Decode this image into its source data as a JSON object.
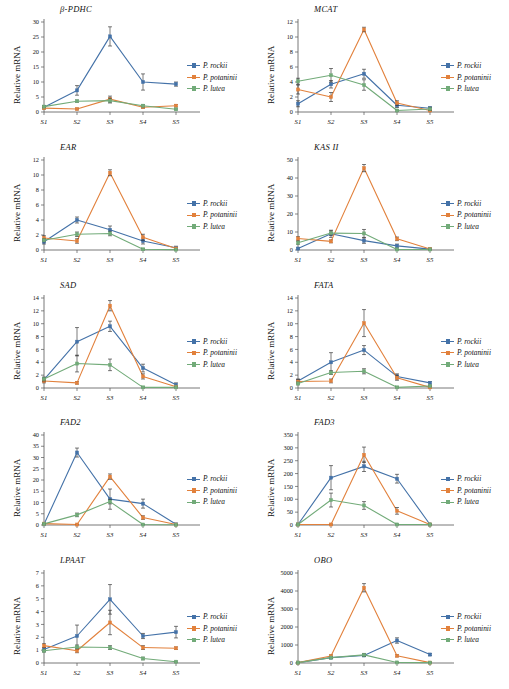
{
  "figure": {
    "axis_ylabel": "Relative mRNA",
    "categories": [
      "S1",
      "S2",
      "S3",
      "S4",
      "S5"
    ],
    "series_names": [
      "P. rockii",
      "P. potaninii",
      "P. lutea"
    ],
    "colors": {
      "p_rockii": "#4472a8",
      "p_potaninii": "#e2813c",
      "p_lutea": "#72ab79"
    }
  },
  "legend": {
    "items": [
      {
        "label": "P. rockii",
        "color": "#4472a8"
      },
      {
        "label": "P. potaninii",
        "color": "#e2813c"
      },
      {
        "label": "P. lutea",
        "color": "#72ab79"
      }
    ]
  },
  "chart_data": [
    {
      "type": "line",
      "title": "β-PDHC",
      "xlabel": "",
      "ylabel": "Relative mRNA",
      "categories": [
        "S1",
        "S2",
        "S3",
        "S4",
        "S5"
      ],
      "yticks": [
        0,
        5,
        10,
        15,
        20,
        25,
        30
      ],
      "ylim": [
        0,
        30
      ],
      "grid": false,
      "legend_position": "right",
      "series": [
        {
          "name": "P. rockii",
          "color": "#4472a8",
          "values": [
            1.6,
            7.2,
            25.2,
            10.0,
            9.3
          ],
          "errors": [
            0.5,
            1.6,
            3.2,
            2.7,
            0.7
          ]
        },
        {
          "name": "P. potaninii",
          "color": "#e2813c",
          "values": [
            1.3,
            1.0,
            4.3,
            1.6,
            2.1
          ],
          "errors": [
            0.3,
            0.3,
            1.0,
            0.4,
            0.4
          ]
        },
        {
          "name": "P. lutea",
          "color": "#72ab79",
          "values": [
            1.8,
            3.6,
            3.8,
            2.1,
            0.9
          ],
          "errors": [
            0.3,
            0.4,
            0.8,
            0.4,
            0.2
          ]
        }
      ]
    },
    {
      "type": "line",
      "title": "MCAT",
      "xlabel": "",
      "ylabel": "Relative mRNA",
      "categories": [
        "S1",
        "S2",
        "S3",
        "S4",
        "S5"
      ],
      "yticks": [
        0,
        2,
        4,
        6,
        8,
        10,
        12
      ],
      "ylim": [
        0,
        12
      ],
      "grid": false,
      "legend_position": "right",
      "series": [
        {
          "name": "P. rockii",
          "color": "#4472a8",
          "values": [
            1.1,
            3.7,
            5.1,
            0.9,
            0.5
          ],
          "errors": [
            0.4,
            0.5,
            0.6,
            0.3,
            0.2
          ]
        },
        {
          "name": "P. potaninii",
          "color": "#e2813c",
          "values": [
            3.0,
            2.0,
            11.0,
            1.2,
            0.2
          ],
          "errors": [
            0.6,
            0.6,
            0.3,
            0.3,
            0.1
          ]
        },
        {
          "name": "P. lutea",
          "color": "#72ab79",
          "values": [
            4.1,
            4.9,
            3.6,
            0.2,
            0.4
          ],
          "errors": [
            0.4,
            0.9,
            0.7,
            0.1,
            0.2
          ]
        }
      ]
    },
    {
      "type": "line",
      "title": "EAR",
      "xlabel": "",
      "ylabel": "Relative mRNA",
      "categories": [
        "S1",
        "S2",
        "S3",
        "S4",
        "S5"
      ],
      "yticks": [
        0,
        2,
        4,
        6,
        8,
        10,
        12
      ],
      "ylim": [
        0,
        12
      ],
      "grid": false,
      "legend_position": "right",
      "series": [
        {
          "name": "P. rockii",
          "color": "#4472a8",
          "values": [
            1.1,
            4.0,
            2.7,
            1.2,
            0.3
          ],
          "errors": [
            0.3,
            0.4,
            0.5,
            0.4,
            0.2
          ]
        },
        {
          "name": "P. potaninii",
          "color": "#e2813c",
          "values": [
            1.6,
            1.2,
            10.3,
            1.7,
            0.2
          ],
          "errors": [
            0.3,
            0.3,
            0.4,
            0.4,
            0.1
          ]
        },
        {
          "name": "P. lutea",
          "color": "#72ab79",
          "values": [
            1.3,
            2.1,
            2.2,
            0.1,
            0.05
          ],
          "errors": [
            0.2,
            0.3,
            0.3,
            0.1,
            0.05
          ]
        }
      ]
    },
    {
      "type": "line",
      "title": "KAS II",
      "xlabel": "",
      "ylabel": "Relative mRNA",
      "categories": [
        "S1",
        "S2",
        "S3",
        "S4",
        "S5"
      ],
      "yticks": [
        0,
        10,
        20,
        30,
        40,
        50
      ],
      "ylim": [
        0,
        50
      ],
      "grid": false,
      "legend_position": "right",
      "series": [
        {
          "name": "P. rockii",
          "color": "#4472a8",
          "values": [
            0.8,
            9.0,
            5.2,
            2.3,
            0.5
          ],
          "errors": [
            0.4,
            2.0,
            1.5,
            1.0,
            0.3
          ]
        },
        {
          "name": "P. potaninii",
          "color": "#e2813c",
          "values": [
            6.4,
            4.8,
            45.5,
            6.2,
            0.6
          ],
          "errors": [
            1.0,
            0.8,
            2.0,
            1.0,
            0.3
          ]
        },
        {
          "name": "P. lutea",
          "color": "#72ab79",
          "values": [
            4.0,
            9.4,
            9.2,
            0.3,
            0.3
          ],
          "errors": [
            0.8,
            1.2,
            2.2,
            0.2,
            0.2
          ]
        }
      ]
    },
    {
      "type": "line",
      "title": "SAD",
      "xlabel": "",
      "ylabel": "Relative mRNA",
      "categories": [
        "S1",
        "S2",
        "S3",
        "S4",
        "S5"
      ],
      "yticks": [
        0,
        2,
        4,
        6,
        8,
        10,
        12,
        14
      ],
      "ylim": [
        0,
        14
      ],
      "grid": false,
      "legend_position": "right",
      "series": [
        {
          "name": "P. rockii",
          "color": "#4472a8",
          "values": [
            1.3,
            7.2,
            9.6,
            3.1,
            0.5
          ],
          "errors": [
            0.3,
            2.2,
            0.8,
            0.6,
            0.3
          ]
        },
        {
          "name": "P. potaninii",
          "color": "#e2813c",
          "values": [
            1.1,
            0.8,
            12.8,
            1.8,
            0.2
          ],
          "errors": [
            0.3,
            0.2,
            0.8,
            0.4,
            0.1
          ]
        },
        {
          "name": "P. lutea",
          "color": "#72ab79",
          "values": [
            1.4,
            3.8,
            3.6,
            0.1,
            0.1
          ],
          "errors": [
            0.3,
            1.3,
            0.9,
            0.1,
            0.1
          ]
        }
      ]
    },
    {
      "type": "line",
      "title": "FATA",
      "xlabel": "",
      "ylabel": "Relative mRNA",
      "categories": [
        "S1",
        "S2",
        "S3",
        "S4",
        "S5"
      ],
      "yticks": [
        0,
        2,
        4,
        6,
        8,
        10,
        12,
        14
      ],
      "ylim": [
        0,
        14
      ],
      "grid": false,
      "legend_position": "right",
      "series": [
        {
          "name": "P. rockii",
          "color": "#4472a8",
          "values": [
            1.1,
            4.0,
            5.9,
            1.8,
            0.8
          ],
          "errors": [
            0.3,
            1.5,
            0.7,
            0.4,
            0.2
          ]
        },
        {
          "name": "P. potaninii",
          "color": "#e2813c",
          "values": [
            1.0,
            1.1,
            10.1,
            1.6,
            0.1
          ],
          "errors": [
            0.3,
            0.3,
            2.1,
            0.4,
            0.1
          ]
        },
        {
          "name": "P. lutea",
          "color": "#72ab79",
          "values": [
            0.7,
            2.4,
            2.6,
            0.1,
            0.3
          ],
          "errors": [
            0.2,
            0.3,
            0.4,
            0.1,
            0.1
          ]
        }
      ]
    },
    {
      "type": "line",
      "title": "FAD2",
      "xlabel": "",
      "ylabel": "Relative mRNA",
      "categories": [
        "S1",
        "S2",
        "S3",
        "S4",
        "S5"
      ],
      "yticks": [
        0,
        5,
        10,
        15,
        20,
        25,
        30,
        35,
        40
      ],
      "ylim": [
        0,
        40
      ],
      "grid": false,
      "legend_position": "right",
      "series": [
        {
          "name": "P. rockii",
          "color": "#4472a8",
          "values": [
            0.3,
            32.2,
            11.5,
            9.5,
            0.3
          ],
          "errors": [
            0.2,
            2.0,
            4.5,
            2.0,
            0.2
          ]
        },
        {
          "name": "P. potaninii",
          "color": "#e2813c",
          "values": [
            0.6,
            0.2,
            21.5,
            3.3,
            0.2
          ],
          "errors": [
            0.2,
            0.1,
            1.2,
            0.8,
            0.1
          ]
        },
        {
          "name": "P. lutea",
          "color": "#72ab79",
          "values": [
            0.5,
            4.5,
            10.4,
            0.2,
            0.1
          ],
          "errors": [
            0.2,
            0.8,
            1.0,
            0.1,
            0.1
          ]
        }
      ]
    },
    {
      "type": "line",
      "title": "FAD3",
      "xlabel": "",
      "ylabel": "Relative mRNA",
      "categories": [
        "S1",
        "S2",
        "S3",
        "S4",
        "S5"
      ],
      "yticks": [
        0,
        50,
        100,
        150,
        200,
        250,
        300,
        350
      ],
      "ylim": [
        0,
        350
      ],
      "grid": false,
      "legend_position": "right",
      "series": [
        {
          "name": "P. rockii",
          "color": "#4472a8",
          "values": [
            2,
            184,
            228,
            180,
            2
          ],
          "errors": [
            2,
            47,
            20,
            17,
            2
          ]
        },
        {
          "name": "P. potaninii",
          "color": "#e2813c",
          "values": [
            2,
            2,
            273,
            55,
            2
          ],
          "errors": [
            2,
            2,
            30,
            13,
            2
          ]
        },
        {
          "name": "P. lutea",
          "color": "#72ab79",
          "values": [
            2,
            97,
            76,
            2,
            2
          ],
          "errors": [
            2,
            27,
            15,
            2,
            2
          ]
        }
      ]
    },
    {
      "type": "line",
      "title": "LPAAT",
      "xlabel": "",
      "ylabel": "Relative mRNA",
      "categories": [
        "S1",
        "S2",
        "S3",
        "S4",
        "S5"
      ],
      "yticks": [
        0,
        1,
        2,
        3,
        4,
        5,
        6,
        7
      ],
      "ylim": [
        0,
        7
      ],
      "grid": false,
      "legend_position": "right",
      "series": [
        {
          "name": "P. rockii",
          "color": "#4472a8",
          "values": [
            1.05,
            2.1,
            4.95,
            2.1,
            2.4
          ],
          "errors": [
            0.15,
            0.85,
            1.15,
            0.2,
            0.45
          ]
        },
        {
          "name": "P. potaninii",
          "color": "#e2813c",
          "values": [
            1.35,
            0.95,
            3.15,
            1.2,
            1.15
          ],
          "errors": [
            0.15,
            0.15,
            0.95,
            0.15,
            0.1
          ]
        },
        {
          "name": "P. lutea",
          "color": "#72ab79",
          "values": [
            0.95,
            1.25,
            1.2,
            0.35,
            0.1
          ],
          "errors": [
            0.1,
            0.15,
            0.15,
            0.1,
            0.05
          ]
        }
      ]
    },
    {
      "type": "line",
      "title": "OBO",
      "xlabel": "",
      "ylabel": "Relative mRNA",
      "categories": [
        "S1",
        "S2",
        "S3",
        "S4",
        "S5"
      ],
      "yticks": [
        0,
        1000,
        2000,
        3000,
        4000,
        5000
      ],
      "ylim": [
        0,
        5000
      ],
      "grid": false,
      "legend_position": "right",
      "series": [
        {
          "name": "P. rockii",
          "color": "#4472a8",
          "values": [
            20,
            300,
            420,
            1250,
            470
          ],
          "errors": [
            20,
            60,
            60,
            150,
            60
          ]
        },
        {
          "name": "P. potaninii",
          "color": "#e2813c",
          "values": [
            20,
            390,
            4180,
            400,
            20
          ],
          "errors": [
            20,
            60,
            230,
            60,
            20
          ]
        },
        {
          "name": "P. lutea",
          "color": "#72ab79",
          "values": [
            20,
            300,
            450,
            30,
            20
          ],
          "errors": [
            20,
            50,
            80,
            20,
            20
          ]
        }
      ]
    }
  ]
}
